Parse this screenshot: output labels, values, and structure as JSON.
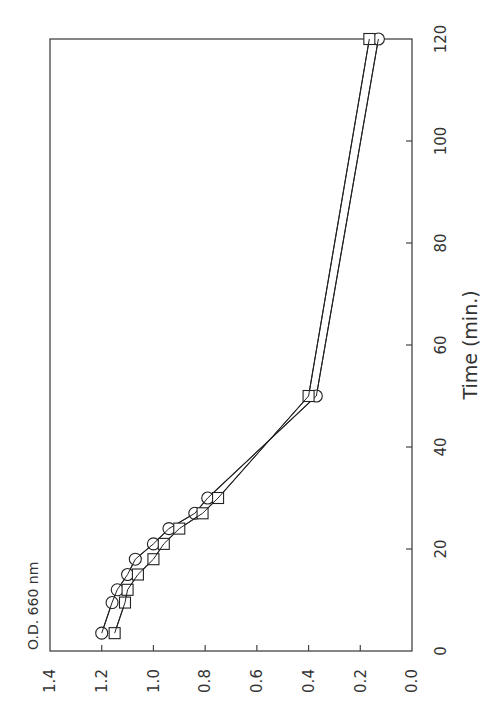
{
  "chart_data": {
    "type": "line",
    "orientation": "rotated-90-ccw",
    "title": "",
    "xlabel": "Time (min.)",
    "ylabel": "O.D. 660 nm",
    "xlim": [
      0,
      120
    ],
    "ylim": [
      0.0,
      1.4
    ],
    "x_ticks": [
      "0",
      "20",
      "40",
      "60",
      "80",
      "100",
      "120"
    ],
    "y_ticks": [
      "0.0",
      "0.2",
      "0.4",
      "0.6",
      "0.8",
      "1.0",
      "1.2",
      "1.4"
    ],
    "grid": false,
    "legend": null,
    "x": [
      3.5,
      9.5,
      12,
      15,
      18,
      21,
      24,
      27,
      30,
      50,
      120
    ],
    "series": [
      {
        "name": "circles",
        "marker": "circle",
        "values": [
          1.2,
          1.16,
          1.14,
          1.1,
          1.07,
          1.0,
          0.94,
          0.84,
          0.79,
          0.37,
          0.13
        ]
      },
      {
        "name": "squares",
        "marker": "square",
        "values": [
          1.15,
          1.11,
          1.1,
          1.06,
          1.0,
          0.96,
          0.9,
          0.81,
          0.75,
          0.4,
          0.165
        ]
      }
    ]
  }
}
